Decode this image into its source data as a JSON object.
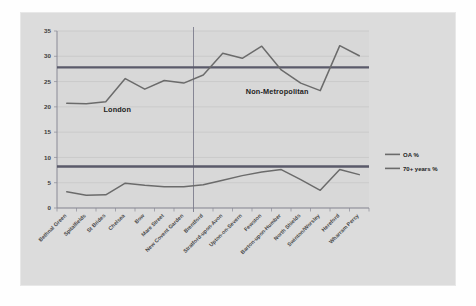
{
  "chart_data": {
    "type": "line",
    "title": "",
    "xlabel": "",
    "ylabel": "",
    "ylim": [
      0,
      35
    ],
    "yticks": [
      "0",
      "5",
      "10",
      "15",
      "20",
      "25",
      "30",
      "35"
    ],
    "grid": true,
    "legend_position": "right",
    "categories": [
      "Bethnal Green",
      "Spitalfields",
      "St Brides",
      "Chelsea",
      "Bow",
      "Mare Street",
      "New Covent Garden",
      "Brentford",
      "Stratford-upon-Avon",
      "Upton-on-Severn",
      "Fewston",
      "Barton-upon-Humber",
      "North Shields",
      "Swinton/Worsley",
      "Hereford",
      "Wharram Percy"
    ],
    "series": [
      {
        "name": "OA %",
        "color": "#6b6b6b",
        "values": [
          20.7,
          20.6,
          21.0,
          25.6,
          23.5,
          25.2,
          24.7,
          26.3,
          30.6,
          29.6,
          32.0,
          27.3,
          24.7,
          23.2,
          32.1,
          30.1
        ]
      },
      {
        "name": "70+ years %",
        "color": "#6b6b6b",
        "values": [
          3.2,
          2.5,
          2.6,
          4.9,
          4.5,
          4.2,
          4.2,
          4.6,
          5.5,
          6.4,
          7.1,
          7.6,
          5.6,
          3.5,
          7.6,
          6.6
        ]
      }
    ],
    "reference_lines": [
      {
        "name": "OA % mean",
        "value": 27.8,
        "color": "#5a5a6a"
      },
      {
        "name": "70+ years % mean",
        "value": 8.2,
        "color": "#5a5a6a"
      }
    ],
    "annotations": [
      {
        "name": "london-region-label",
        "text": "London"
      },
      {
        "name": "non-metropolitan-region-label",
        "text": "Non-Metropolitan"
      }
    ],
    "divider": {
      "name": "region-divider",
      "after_category_index": 6
    }
  },
  "legend": {
    "items": [
      {
        "label": "OA %"
      },
      {
        "label": "70+ years %"
      }
    ]
  },
  "colors": {
    "plot_background": "#dcdcdc",
    "figure_background": "#fefefe",
    "gridline": "#c4c4c4",
    "axis": "#8a8a96",
    "series_line": "#6b6b6b",
    "reference_line": "#5a5a6a",
    "text": "#333333"
  }
}
